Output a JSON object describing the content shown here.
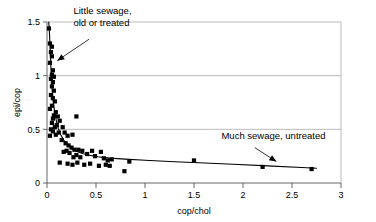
{
  "chart_data": {
    "type": "scatter",
    "title": "",
    "xlabel": "cop/chol",
    "ylabel": "epi/cop",
    "xlim": [
      0,
      3
    ],
    "ylim": [
      0,
      1.5
    ],
    "xticks": [
      "0",
      "0.5",
      "1",
      "1.5",
      "2",
      "2.5",
      "3"
    ],
    "xtick_values": [
      0,
      0.5,
      1,
      1.5,
      2,
      2.5,
      3
    ],
    "yticks": [
      "0",
      "0.5",
      "1",
      "1.5"
    ],
    "ytick_values": [
      0,
      0.5,
      1,
      1.5
    ],
    "grid": "horizontal",
    "legend": "none",
    "marker_style": "filled-square",
    "marker_color": "#000000",
    "series": [
      {
        "name": "samples",
        "points": [
          [
            0.02,
            1.44
          ],
          [
            0.03,
            1.3
          ],
          [
            0.05,
            1.27
          ],
          [
            0.04,
            1.22
          ],
          [
            0.05,
            1.18
          ],
          [
            0.03,
            1.12
          ],
          [
            0.06,
            1.05
          ],
          [
            0.05,
            1.01
          ],
          [
            0.07,
            0.99
          ],
          [
            0.04,
            0.97
          ],
          [
            0.06,
            0.94
          ],
          [
            0.05,
            0.9
          ],
          [
            0.07,
            0.86
          ],
          [
            0.04,
            0.82
          ],
          [
            0.06,
            0.79
          ],
          [
            0.08,
            0.76
          ],
          [
            0.05,
            0.72
          ],
          [
            0.03,
            0.69
          ],
          [
            0.09,
            0.66
          ],
          [
            0.07,
            0.63
          ],
          [
            0.11,
            0.62
          ],
          [
            0.06,
            0.6
          ],
          [
            0.13,
            0.58
          ],
          [
            0.05,
            0.56
          ],
          [
            0.1,
            0.54
          ],
          [
            0.08,
            0.52
          ],
          [
            0.04,
            0.5
          ],
          [
            0.06,
            0.48
          ],
          [
            0.12,
            0.47
          ],
          [
            0.09,
            0.45
          ],
          [
            0.03,
            0.44
          ],
          [
            0.16,
            0.52
          ],
          [
            0.18,
            0.47
          ],
          [
            0.21,
            0.44
          ],
          [
            0.3,
            0.62
          ],
          [
            0.26,
            0.45
          ],
          [
            0.15,
            0.4
          ],
          [
            0.19,
            0.37
          ],
          [
            0.22,
            0.35
          ],
          [
            0.25,
            0.33
          ],
          [
            0.28,
            0.31
          ],
          [
            0.2,
            0.3
          ],
          [
            0.17,
            0.29
          ],
          [
            0.23,
            0.28
          ],
          [
            0.32,
            0.31
          ],
          [
            0.36,
            0.3
          ],
          [
            0.3,
            0.26
          ],
          [
            0.27,
            0.24
          ],
          [
            0.34,
            0.24
          ],
          [
            0.41,
            0.27
          ],
          [
            0.46,
            0.3
          ],
          [
            0.49,
            0.25
          ],
          [
            0.55,
            0.29
          ],
          [
            0.58,
            0.23
          ],
          [
            0.62,
            0.21
          ],
          [
            0.6,
            0.17
          ],
          [
            0.64,
            0.16
          ],
          [
            0.66,
            0.22
          ],
          [
            0.53,
            0.16
          ],
          [
            0.44,
            0.18
          ],
          [
            0.38,
            0.17
          ],
          [
            0.13,
            0.19
          ],
          [
            0.21,
            0.18
          ],
          [
            0.26,
            0.17
          ],
          [
            0.31,
            0.19
          ],
          [
            0.84,
            0.2
          ],
          [
            0.79,
            0.11
          ],
          [
            1.5,
            0.21
          ],
          [
            2.2,
            0.15
          ],
          [
            2.7,
            0.13
          ]
        ]
      }
    ],
    "fit_curve": {
      "name": "fitted-decay-curve",
      "points": [
        [
          0.018,
          1.5
        ],
        [
          0.025,
          1.4
        ],
        [
          0.032,
          1.25
        ],
        [
          0.04,
          1.08
        ],
        [
          0.05,
          0.92
        ],
        [
          0.062,
          0.78
        ],
        [
          0.078,
          0.66
        ],
        [
          0.095,
          0.58
        ],
        [
          0.115,
          0.51
        ],
        [
          0.14,
          0.45
        ],
        [
          0.17,
          0.4
        ],
        [
          0.205,
          0.36
        ],
        [
          0.25,
          0.32
        ],
        [
          0.3,
          0.295
        ],
        [
          0.36,
          0.275
        ],
        [
          0.43,
          0.258
        ],
        [
          0.52,
          0.245
        ],
        [
          0.64,
          0.232
        ],
        [
          0.8,
          0.222
        ],
        [
          1.0,
          0.212
        ],
        [
          1.25,
          0.2
        ],
        [
          1.55,
          0.188
        ],
        [
          1.9,
          0.175
        ],
        [
          2.25,
          0.16
        ],
        [
          2.6,
          0.145
        ],
        [
          2.75,
          0.138
        ]
      ]
    },
    "annotations": [
      {
        "id": "little-sewage",
        "lines": [
          "Little sewage,",
          "old or treated"
        ],
        "text_x": 0.27,
        "text_y": 1.57,
        "arrow_from": [
          0.43,
          1.34
        ],
        "arrow_to": [
          0.105,
          1.14
        ]
      },
      {
        "id": "much-sewage",
        "lines": [
          "Much sewage, untreated"
        ],
        "text_x": 1.78,
        "text_y": 0.41,
        "arrow_from": [
          2.12,
          0.33
        ],
        "arrow_to": [
          2.34,
          0.2
        ]
      }
    ]
  }
}
